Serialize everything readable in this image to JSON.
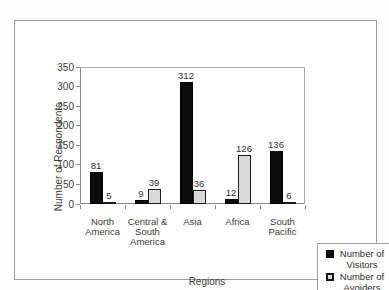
{
  "figure": {
    "background": "#ffffff",
    "frame_border_color": "#9e9e9e",
    "axis_line_color": "#8a8a8a"
  },
  "chart_data": {
    "type": "bar",
    "title": "",
    "xlabel": "Regions",
    "ylabel": "Number of Respondents",
    "categories": [
      "North\nAmerica",
      "Central &\nSouth\nAmerica",
      "Asia",
      "Africa",
      "South\nPacific"
    ],
    "series": [
      {
        "name": "Number of Visitors",
        "values": [
          81,
          9,
          312,
          12,
          136
        ],
        "fill": "#0c0c0c",
        "border": "#000000"
      },
      {
        "name": "Number of Avoiders",
        "values": [
          5,
          39,
          36,
          126,
          6
        ],
        "fill": "#d9d9d9",
        "border": "#1c1c1c"
      }
    ],
    "ylim": [
      0,
      350
    ],
    "y_ticks": [
      0,
      50,
      100,
      150,
      200,
      250,
      300,
      350
    ],
    "grid": false,
    "data_labels": true,
    "legend_position": "bottom-right"
  }
}
